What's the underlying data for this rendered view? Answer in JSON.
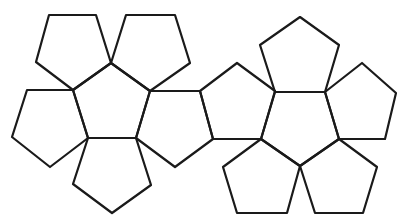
{
  "diagram": {
    "title": "Dodecahedron net",
    "stroke_color": "#1a1a1a",
    "stroke_width": 2.2,
    "background": "#ffffff",
    "face_count": 12,
    "faces": [
      {
        "id": "left-center",
        "cluster": "left",
        "points": [
          [
            111,
            63
          ],
          [
            150,
            91
          ],
          [
            136,
            138
          ],
          [
            88,
            138
          ],
          [
            73,
            90
          ]
        ]
      },
      {
        "id": "left-top-left",
        "cluster": "left",
        "points": [
          [
            49,
            15
          ],
          [
            96,
            15
          ],
          [
            111,
            63
          ],
          [
            73,
            90
          ],
          [
            36,
            62
          ]
        ]
      },
      {
        "id": "left-top-right",
        "cluster": "left",
        "points": [
          [
            126,
            15
          ],
          [
            175,
            15
          ],
          [
            190,
            63
          ],
          [
            150,
            91
          ],
          [
            111,
            63
          ]
        ]
      },
      {
        "id": "left-left",
        "cluster": "left",
        "points": [
          [
            27,
            90
          ],
          [
            73,
            90
          ],
          [
            88,
            138
          ],
          [
            50,
            167
          ],
          [
            12,
            137
          ]
        ]
      },
      {
        "id": "left-bottom",
        "cluster": "left",
        "points": [
          [
            88,
            138
          ],
          [
            136,
            138
          ],
          [
            151,
            185
          ],
          [
            112,
            213
          ],
          [
            73,
            184
          ]
        ]
      },
      {
        "id": "left-right",
        "cluster": "left",
        "points": [
          [
            150,
            91
          ],
          [
            200,
            91
          ],
          [
            213,
            139
          ],
          [
            175,
            167
          ],
          [
            136,
            138
          ]
        ]
      },
      {
        "id": "bridge",
        "cluster": "connector",
        "points": [
          [
            237,
            63
          ],
          [
            275,
            91
          ],
          [
            261,
            139
          ],
          [
            213,
            139
          ],
          [
            200,
            91
          ]
        ]
      },
      {
        "id": "right-center",
        "cluster": "right",
        "points": [
          [
            275,
            92
          ],
          [
            325,
            92
          ],
          [
            339,
            139
          ],
          [
            300,
            166
          ],
          [
            261,
            139
          ]
        ]
      },
      {
        "id": "right-top",
        "cluster": "right",
        "points": [
          [
            260,
            45
          ],
          [
            300,
            17
          ],
          [
            339,
            45
          ],
          [
            325,
            92
          ],
          [
            275,
            92
          ]
        ]
      },
      {
        "id": "right-right",
        "cluster": "right",
        "points": [
          [
            325,
            92
          ],
          [
            362,
            63
          ],
          [
            396,
            93
          ],
          [
            385,
            139
          ],
          [
            339,
            139
          ]
        ]
      },
      {
        "id": "right-bottom-left",
        "cluster": "right",
        "points": [
          [
            261,
            139
          ],
          [
            300,
            166
          ],
          [
            287,
            213
          ],
          [
            237,
            213
          ],
          [
            223,
            167
          ]
        ]
      },
      {
        "id": "right-bottom-right",
        "cluster": "right",
        "points": [
          [
            300,
            166
          ],
          [
            339,
            139
          ],
          [
            377,
            167
          ],
          [
            363,
            213
          ],
          [
            315,
            213
          ]
        ]
      }
    ]
  }
}
